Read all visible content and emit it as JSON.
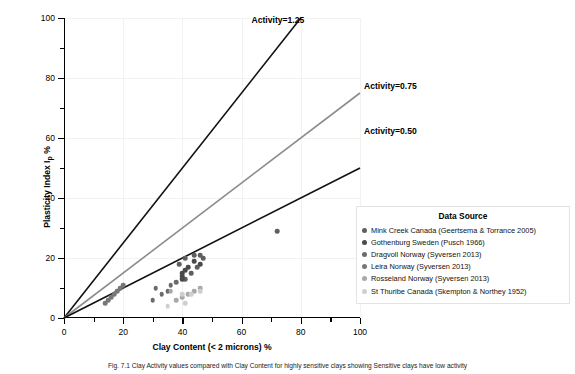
{
  "chart_data": {
    "type": "scatter",
    "title": "",
    "xlabel": "Clay Content (< 2 microns) %",
    "ylabel": "Plasticity Index I",
    "ylabel_sub": "p",
    "ylabel_suffix": " %",
    "xlim": [
      0,
      100
    ],
    "ylim": [
      0,
      100
    ],
    "xticks": [
      0,
      20,
      40,
      60,
      80,
      100
    ],
    "yticks": [
      0,
      20,
      40,
      60,
      80,
      100
    ],
    "xminor": [
      10,
      30,
      50,
      70,
      90
    ],
    "yminor": [
      10,
      30,
      50,
      70,
      90
    ],
    "grid": true,
    "legend_position": "right-lower",
    "legend_title": "Data Source",
    "reference_lines": [
      {
        "name": "Activity=1.25",
        "label": "Activity=1.25",
        "slope": 1.25,
        "color": "#111111",
        "label_x": 62,
        "label_y": 99
      },
      {
        "name": "Activity=0.75",
        "label": "Activity=0.75",
        "slope": 0.75,
        "color": "#8c8c8c",
        "label_x": 100,
        "label_y": 77
      },
      {
        "name": "Activity=0.50",
        "label": "Activity=0.50",
        "slope": 0.5,
        "color": "#111111",
        "label_x": 100,
        "label_y": 62
      }
    ],
    "series": [
      {
        "name": "Mink Creek Canada (Geertsema & Torrance 2005)",
        "color": "#5f5f5f",
        "points": [
          [
            39,
            18
          ],
          [
            41,
            20
          ],
          [
            44,
            21
          ],
          [
            46,
            21
          ],
          [
            47,
            20
          ],
          [
            43,
            15
          ],
          [
            41,
            13
          ],
          [
            45,
            17
          ],
          [
            72,
            29
          ]
        ]
      },
      {
        "name": "Gothenburg Sweden (Pusch 1966)",
        "color": "#4a4a4a",
        "points": [
          [
            40,
            15
          ],
          [
            40,
            14
          ],
          [
            40,
            13
          ],
          [
            41,
            16
          ],
          [
            42,
            17
          ],
          [
            44,
            19
          ],
          [
            46,
            18
          ]
        ]
      },
      {
        "name": "Dragvoll Norway (Syversen 2013)",
        "color": "#6b6b6b",
        "points": [
          [
            31,
            10
          ],
          [
            33,
            8
          ],
          [
            35,
            9
          ],
          [
            36,
            11
          ],
          [
            38,
            12
          ],
          [
            30,
            6
          ]
        ]
      },
      {
        "name": "Leira Norway (Syversen 2013)",
        "color": "#777777",
        "points": [
          [
            14,
            5
          ],
          [
            16,
            7
          ],
          [
            17,
            8
          ],
          [
            18,
            9
          ],
          [
            19,
            10
          ],
          [
            20,
            11
          ],
          [
            15,
            6
          ]
        ]
      },
      {
        "name": "Rosseland Norway (Syversen 2013)",
        "color": "#a8a8a8",
        "points": [
          [
            36,
            9
          ],
          [
            40,
            7
          ],
          [
            42,
            8
          ],
          [
            44,
            9
          ],
          [
            46,
            10
          ],
          [
            38,
            6
          ]
        ]
      },
      {
        "name": "St Thuribe Canada (Skempton & Northey 1952)",
        "color": "#cfcfcf",
        "points": [
          [
            40,
            8
          ],
          [
            43,
            8
          ],
          [
            46,
            9
          ],
          [
            41,
            5
          ],
          [
            35,
            4
          ]
        ]
      }
    ]
  },
  "caption": {
    "text": "Fig. 7.1 Clay Activity values compared with Clay Content for highly sensitive clays showing Sensitive clays have low activity"
  }
}
